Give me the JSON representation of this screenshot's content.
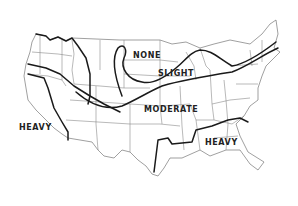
{
  "map": {
    "type": "zone map",
    "region": "Continental United States",
    "colors": {
      "background": "#ffffff",
      "zone_line": "#1a1a1a",
      "state_line": "#8a8a8a",
      "label": "#222222"
    },
    "labels": {
      "none": "NONE",
      "slight": "SLIGHT",
      "moderate": "MODERATE",
      "heavy_west": "HEAVY",
      "heavy_southeast": "HEAVY"
    }
  }
}
